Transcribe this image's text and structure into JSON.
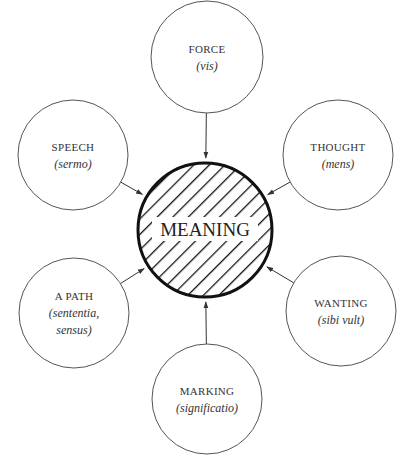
{
  "diagram": {
    "center": {
      "label": "MEANING",
      "cx": 205,
      "cy": 230,
      "r": 67
    },
    "nodes": [
      {
        "id": "force",
        "label": "FORCE",
        "sub_lines": [
          "(vis)"
        ],
        "cx": 207,
        "cy": 57,
        "r": 56
      },
      {
        "id": "speech",
        "label": "SPEECH",
        "sub_lines": [
          "(sermo)"
        ],
        "cx": 73,
        "cy": 155,
        "r": 55
      },
      {
        "id": "thought",
        "label": "THOUGHT",
        "sub_lines": [
          "(mens)"
        ],
        "cx": 338,
        "cy": 155,
        "r": 55
      },
      {
        "id": "path",
        "label": "A PATH",
        "sub_lines": [
          "(sententia,",
          "sensus)"
        ],
        "cx": 74,
        "cy": 313,
        "r": 55
      },
      {
        "id": "wanting",
        "label": "WANTING",
        "sub_lines": [
          "(sibi vult)"
        ],
        "cx": 341,
        "cy": 311,
        "r": 55
      },
      {
        "id": "marking",
        "label": "MARKING",
        "sub_lines": [
          "(significatio)"
        ],
        "cx": 207,
        "cy": 399,
        "r": 55
      }
    ]
  }
}
